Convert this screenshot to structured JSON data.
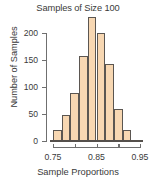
{
  "chart_data": {
    "type": "bar",
    "title": "Samples of Size 100",
    "xlabel": "Sample Proportions",
    "ylabel": "Number of Samples",
    "bin_width": 0.02,
    "categories": [
      "0.75-0.77",
      "0.77-0.79",
      "0.79-0.81",
      "0.81-0.83",
      "0.83-0.85",
      "0.85-0.87",
      "0.87-0.89",
      "0.89-0.91",
      "0.91-0.93"
    ],
    "bin_edges": [
      0.75,
      0.77,
      0.79,
      0.81,
      0.83,
      0.85,
      0.87,
      0.89,
      0.91,
      0.93
    ],
    "values": [
      20,
      48,
      88,
      158,
      230,
      200,
      143,
      59,
      21
    ],
    "xlim": [
      0.75,
      0.95
    ],
    "ylim": [
      0,
      230
    ],
    "xticks": [
      0.75,
      0.8,
      0.85,
      0.9,
      0.95
    ],
    "xtick_labels": [
      "0.75",
      "",
      "0.85",
      "",
      "0.95"
    ],
    "yticks": [
      0,
      50,
      100,
      150,
      200
    ],
    "ytick_labels": [
      "0",
      "50",
      "100",
      "150",
      "200"
    ],
    "grid": false,
    "legend": false,
    "bar_fill_color": "#f7d7b2",
    "bar_edge_color": "#5b5651",
    "axis_color": "#6f6f6f",
    "text_color": "#3a3a3a"
  }
}
